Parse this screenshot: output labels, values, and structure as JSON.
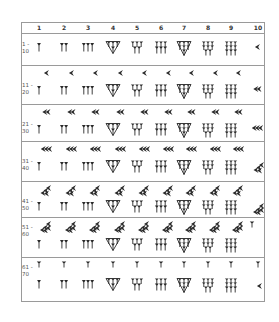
{
  "table": {
    "columns": [
      "1",
      "2",
      "3",
      "4",
      "5",
      "6",
      "7",
      "8",
      "9",
      "10"
    ],
    "rows": [
      {
        "label_top": "1 -",
        "label_bottom": "10",
        "tens": 0,
        "sixties": 0,
        "last_col": "10"
      },
      {
        "label_top": "11 -",
        "label_bottom": "20",
        "tens": 1,
        "sixties": 0,
        "last_col": "20"
      },
      {
        "label_top": "21 -",
        "label_bottom": "30",
        "tens": 2,
        "sixties": 0,
        "last_col": "30"
      },
      {
        "label_top": "31 -",
        "label_bottom": "40",
        "tens": 3,
        "sixties": 0,
        "last_col": "40"
      },
      {
        "label_top": "41 -",
        "label_bottom": "50",
        "tens": 4,
        "sixties": 0,
        "last_col": "50"
      },
      {
        "label_top": "51 -",
        "label_bottom": "60",
        "tens": 5,
        "sixties": 0,
        "last_col": "60"
      },
      {
        "label_top": "61 -",
        "label_bottom": "70",
        "tens": 0,
        "sixties": 1,
        "last_col": "70"
      }
    ]
  },
  "glyphs": {
    "unit": "vertical-wedge-icon",
    "ten": "corner-wedge-icon",
    "sixty": "vertical-wedge-icon"
  },
  "colors": {
    "ink": "#2a2a2a",
    "border": "#9a9a9a",
    "label": "#555555"
  }
}
